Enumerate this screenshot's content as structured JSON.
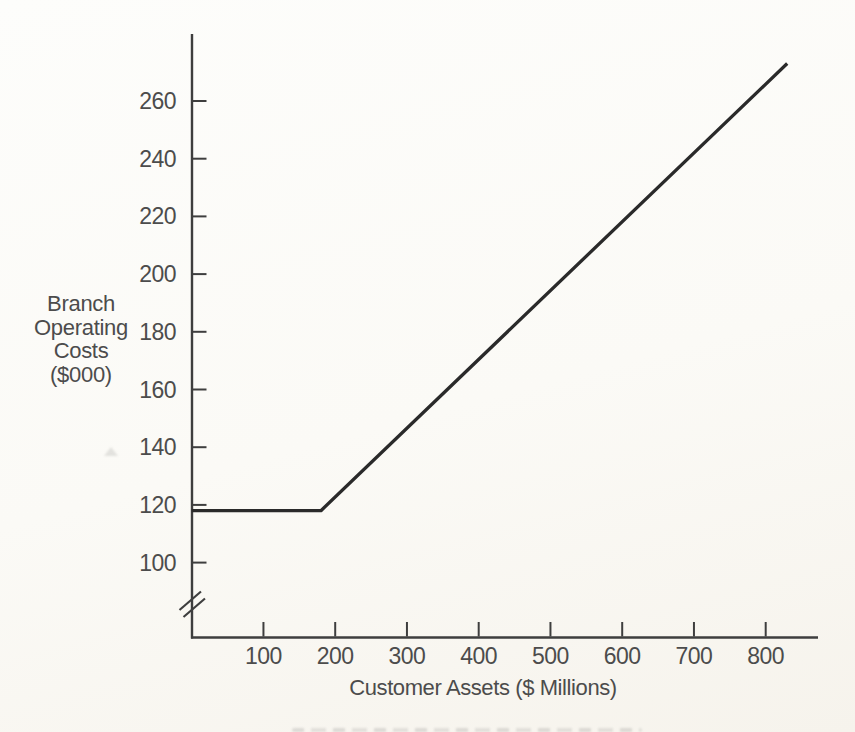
{
  "page": {
    "kind": "scanned book figure",
    "paper_color": "#fbfaf6",
    "ink_color": "#4c4c4c",
    "axis_color": "#3e3e3e"
  },
  "chart_data": {
    "type": "line",
    "title": "",
    "xlabel": "Customer Assets ($ Millions)",
    "ylabel": "Branch Operating Costs ($000)",
    "ylabel_lines": [
      "Branch",
      "Operating",
      "Costs",
      "($000)"
    ],
    "x_ticks": [
      100,
      200,
      300,
      400,
      500,
      600,
      700,
      800
    ],
    "y_ticks": [
      260,
      240,
      220,
      200,
      180,
      160,
      140,
      120,
      100
    ],
    "xlim": [
      0,
      875
    ],
    "ylim": [
      0,
      284
    ],
    "y_axis_break_below": 100,
    "grid": false,
    "legend_position": null,
    "series": [
      {
        "name": "branch-operating-cost-line",
        "color": "#2a2a2a",
        "points": [
          [
            0,
            118
          ],
          [
            180,
            118
          ],
          [
            830,
            273
          ]
        ]
      }
    ]
  }
}
